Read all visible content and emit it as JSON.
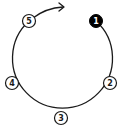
{
  "diagram": {
    "type": "cycle",
    "direction": "clockwise",
    "colors": {
      "line": "#1a1a1a",
      "active_fill": "#000000",
      "active_text": "#ffffff",
      "node_fill": "#ffffff",
      "node_text": "#1a1a1a"
    },
    "nodes": [
      {
        "label": "1",
        "active": true
      },
      {
        "label": "2",
        "active": false
      },
      {
        "label": "3",
        "active": false
      },
      {
        "label": "4",
        "active": false
      },
      {
        "label": "5",
        "active": false
      }
    ],
    "arrow": {
      "from": "5",
      "to": "1"
    }
  }
}
